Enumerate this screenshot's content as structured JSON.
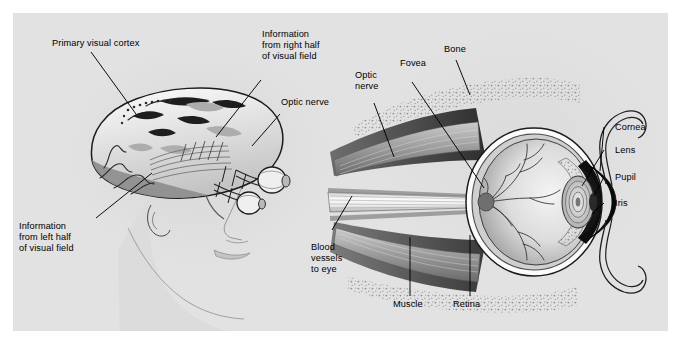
{
  "figure": {
    "background_color": "#ffffff",
    "panel_color": "#e2e2e2",
    "ink_color": "#000000"
  },
  "labels": {
    "primary_visual_cortex": "Primary visual cortex",
    "info_right_half": "Information\nfrom right half\nof visual field",
    "optic_nerve_brain": "Optic nerve",
    "info_left_half": "Information\nfrom left half\nof visual field",
    "optic_nerve_eye": "Optic\nnerve",
    "fovea": "Fovea",
    "bone": "Bone",
    "cornea": "Cornea",
    "lens": "Lens",
    "pupil": "Pupil",
    "iris": "Iris",
    "blood_vessels": "Blood\nvessels\nto eye",
    "muscle": "Muscle",
    "retina": "Retina"
  },
  "palette": {
    "panel": "#e2e2e2",
    "face_line": "#8e8e8e",
    "face_fill": "#dcdcdc",
    "brain_outline": "#1b1b1b",
    "brain_cortex": "#8a8a8a",
    "brain_white": "#f2f2f2",
    "brain_mid": "#b9b9b9",
    "muscle_dark": "#4c4c4c",
    "muscle_mid": "#7a7a7a",
    "muscle_light": "#c9c9c9",
    "nerve_light": "#ececec",
    "sclera": "#fbfbfb",
    "vitreous_light": "#e8e8e8",
    "vitreous_dark": "#9a9a9a",
    "choroid": "#6f6f6f",
    "cornea_dark": "#101010",
    "lens_ring": "#d6d6d6",
    "bone_stipple": "#9c9c9c",
    "leader": "#000000"
  }
}
